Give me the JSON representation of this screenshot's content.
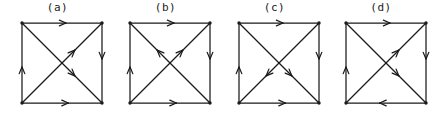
{
  "page": {
    "background_color": "#ffffff",
    "ink_color": "#1a1a1a",
    "width": 438,
    "height": 114
  },
  "figures": [
    {
      "label": "(a)",
      "panel_x": 0,
      "panel_width": 115,
      "square": {
        "x": 22,
        "y": 5,
        "size": 80
      },
      "edges": [
        {
          "name": "top-edge",
          "from": "top-left",
          "to": "top-right",
          "direction": "right",
          "arrow_at": "0.55"
        },
        {
          "name": "right-edge",
          "from": "top-right",
          "to": "bottom-right",
          "direction": "down",
          "arrow_at": "0.45"
        },
        {
          "name": "bottom-edge",
          "from": "bottom-left",
          "to": "bottom-right",
          "direction": "right",
          "arrow_at": "0.58"
        },
        {
          "name": "left-edge",
          "from": "bottom-left",
          "to": "top-left",
          "direction": "up",
          "arrow_at": "0.45"
        },
        {
          "name": "diagonal-tl-br",
          "from": "top-left",
          "to": "bottom-right",
          "direction": "down-right",
          "arrow_at": "0.66"
        },
        {
          "name": "diagonal-bl-tr",
          "from": "bottom-left",
          "to": "top-right",
          "direction": "up-right",
          "arrow_at": "0.66"
        }
      ]
    },
    {
      "label": "(b)",
      "panel_x": 108,
      "panel_width": 115,
      "square": {
        "x": 22,
        "y": 5,
        "size": 80
      },
      "edges": [
        {
          "name": "top-edge",
          "from": "top-left",
          "to": "top-right",
          "direction": "right",
          "arrow_at": "0.55"
        },
        {
          "name": "right-edge",
          "from": "top-right",
          "to": "bottom-right",
          "direction": "down",
          "arrow_at": "0.45"
        },
        {
          "name": "bottom-edge",
          "from": "bottom-left",
          "to": "bottom-right",
          "direction": "right",
          "arrow_at": "0.58"
        },
        {
          "name": "left-edge",
          "from": "bottom-left",
          "to": "top-left",
          "direction": "up",
          "arrow_at": "0.45"
        },
        {
          "name": "diagonal-br-tl",
          "from": "bottom-right",
          "to": "top-left",
          "direction": "up-left",
          "arrow_at": "0.66"
        },
        {
          "name": "diagonal-bl-tr",
          "from": "bottom-left",
          "to": "top-right",
          "direction": "up-right",
          "arrow_at": "0.66"
        }
      ]
    },
    {
      "label": "(c)",
      "panel_x": 217,
      "panel_width": 115,
      "square": {
        "x": 22,
        "y": 5,
        "size": 80
      },
      "edges": [
        {
          "name": "top-edge",
          "from": "top-left",
          "to": "top-right",
          "direction": "right",
          "arrow_at": "0.55"
        },
        {
          "name": "right-edge",
          "from": "top-right",
          "to": "bottom-right",
          "direction": "down",
          "arrow_at": "0.45"
        },
        {
          "name": "bottom-edge",
          "from": "bottom-left",
          "to": "bottom-right",
          "direction": "right",
          "arrow_at": "0.58"
        },
        {
          "name": "left-edge",
          "from": "bottom-left",
          "to": "top-left",
          "direction": "up",
          "arrow_at": "0.45"
        },
        {
          "name": "diagonal-tl-br",
          "from": "top-left",
          "to": "bottom-right",
          "direction": "down-right",
          "arrow_at": "0.66"
        },
        {
          "name": "diagonal-tr-bl",
          "from": "top-right",
          "to": "bottom-left",
          "direction": "down-left",
          "arrow_at": "0.66"
        }
      ]
    },
    {
      "label": "(d)",
      "panel_x": 324,
      "panel_width": 114,
      "square": {
        "x": 22,
        "y": 5,
        "size": 80
      },
      "edges": [
        {
          "name": "top-edge",
          "from": "top-left",
          "to": "top-right",
          "direction": "right",
          "arrow_at": "0.55"
        },
        {
          "name": "right-edge",
          "from": "top-right",
          "to": "bottom-right",
          "direction": "down",
          "arrow_at": "0.45"
        },
        {
          "name": "bottom-edge",
          "from": "bottom-right",
          "to": "bottom-left",
          "direction": "left",
          "arrow_at": "0.58"
        },
        {
          "name": "left-edge",
          "from": "bottom-left",
          "to": "top-left",
          "direction": "up",
          "arrow_at": "0.45"
        },
        {
          "name": "diagonal-tl-br",
          "from": "top-left",
          "to": "bottom-right",
          "direction": "down-right",
          "arrow_at": "0.66"
        },
        {
          "name": "diagonal-bl-tr",
          "from": "bottom-left",
          "to": "top-right",
          "direction": "up-right",
          "arrow_at": "0.66"
        }
      ]
    }
  ]
}
